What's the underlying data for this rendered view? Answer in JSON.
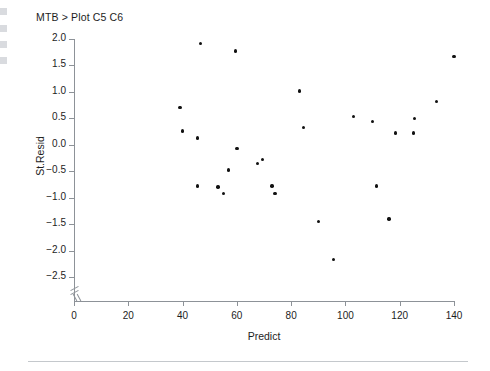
{
  "plot": {
    "title": "MTB > Plot C5 C6",
    "xlabel": "Predict",
    "ylabel": "St.Resid"
  },
  "chart_data": {
    "type": "scatter",
    "title": "MTB > Plot C5 C6",
    "xlabel": "Predict",
    "ylabel": "St.Resid",
    "xlim": [
      0,
      140
    ],
    "ylim": [
      -2.5,
      2.0
    ],
    "xticks": [
      0,
      20,
      40,
      60,
      80,
      100,
      120,
      140
    ],
    "yticks": [
      2.0,
      1.5,
      1.0,
      0.5,
      0.0,
      -0.5,
      -1.0,
      -1.5,
      -2.0,
      -2.5
    ],
    "xtick_labels": [
      "0",
      "20",
      "40",
      "60",
      "80",
      "100",
      "120",
      "140"
    ],
    "ytick_labels": [
      "2.0",
      "1.5",
      "1.0",
      "0.5",
      "0.0",
      "-0.5",
      "-1.0",
      "-1.5",
      "-2.0",
      "-2.5"
    ],
    "grid": false,
    "legend": false,
    "axis_break_x": true,
    "axis_break_y": true,
    "marker": "filled-circle",
    "marker_color": "#111111",
    "axis_color": "#8d9298",
    "n_points": 27,
    "points": [
      {
        "x": 39.0,
        "y": 0.7
      },
      {
        "x": 40.0,
        "y": 0.26
      },
      {
        "x": 45.5,
        "y": 0.13
      },
      {
        "x": 45.5,
        "y": -0.78
      },
      {
        "x": 46.5,
        "y": 1.92
      },
      {
        "x": 53.0,
        "y": -0.8
      },
      {
        "x": 55.0,
        "y": -0.92
      },
      {
        "x": 57.0,
        "y": -0.48
      },
      {
        "x": 59.5,
        "y": 1.77
      },
      {
        "x": 60.0,
        "y": -0.07
      },
      {
        "x": 67.5,
        "y": -0.35
      },
      {
        "x": 69.5,
        "y": -0.28
      },
      {
        "x": 73.0,
        "y": -0.78
      },
      {
        "x": 74.0,
        "y": -0.92
      },
      {
        "x": 83.0,
        "y": 1.02
      },
      {
        "x": 84.5,
        "y": 0.33
      },
      {
        "x": 90.0,
        "y": -1.45
      },
      {
        "x": 95.5,
        "y": -2.17
      },
      {
        "x": 103.0,
        "y": 0.53
      },
      {
        "x": 110.0,
        "y": 0.44
      },
      {
        "x": 111.5,
        "y": -0.78
      },
      {
        "x": 116.0,
        "y": -1.4
      },
      {
        "x": 118.5,
        "y": 0.22
      },
      {
        "x": 125.5,
        "y": 0.5
      },
      {
        "x": 133.5,
        "y": 0.82
      },
      {
        "x": 140.0,
        "y": 1.67
      },
      {
        "x": 125.0,
        "y": 0.22
      }
    ]
  }
}
